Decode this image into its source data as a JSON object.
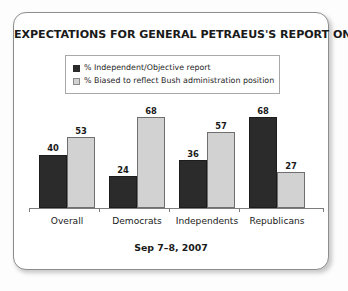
{
  "card": {
    "title": "EXPECTATIONS FOR GENERAL PETRAEUS'S REPORT ON IRAQ",
    "footer": "Sep 7–8, 2007"
  },
  "legend": {
    "items": [
      {
        "label": "% Independent/Objective report",
        "swatch": "dark-swatch-icon",
        "color": "#2b2b2b"
      },
      {
        "label": "% Biased to reflect Bush administration position",
        "swatch": "light-swatch-icon",
        "color": "#d2d2d2"
      }
    ]
  },
  "chart_data": {
    "type": "bar",
    "title": "EXPECTATIONS FOR GENERAL PETRAEUS'S REPORT ON IRAQ",
    "subtitle": "Sep 7–8, 2007",
    "categories": [
      "Overall",
      "Democrats",
      "Independents",
      "Republicans"
    ],
    "series": [
      {
        "name": "% Independent/Objective report",
        "color": "#2b2b2b",
        "values": [
          40,
          24,
          36,
          68
        ]
      },
      {
        "name": "% Biased to reflect Bush administration position",
        "color": "#d2d2d2",
        "values": [
          53,
          68,
          57,
          27
        ]
      }
    ],
    "xlabel": "",
    "ylabel": "",
    "ylim": [
      0,
      75
    ],
    "grid": false,
    "legend_position": "top-center",
    "value_labels": true
  }
}
